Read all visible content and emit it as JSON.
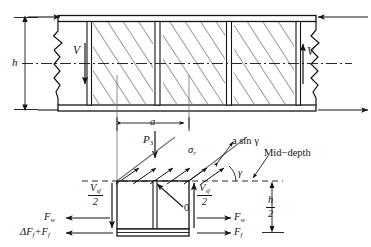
{
  "figure": {
    "type": "engineering-diagram",
    "colors": {
      "line": "#141414",
      "hatch": "#6e6e6e",
      "dash": "#2a2a2a",
      "background": "#ffffff"
    }
  },
  "upper_panel": {
    "name": "girder-elevation",
    "height_label": "h",
    "shear_left_label": "V",
    "shear_right_label": "V",
    "midline_style": "dash-dot",
    "stiffener_count": 4,
    "tension_field_angle_deg": 33
  },
  "lower_panel": {
    "name": "free-body-diagram",
    "panel_width_label": "a",
    "load_label": "P",
    "load_subscript": "3",
    "stress_label": "σ",
    "stress_subscript": "r",
    "diagonal_label": "a sin γ",
    "mid_depth_label": "Mid−depth",
    "angle_label": "γ",
    "origin_label": "0",
    "half_depth": {
      "numerator": "h",
      "denominator": "2"
    },
    "shear_left": {
      "symbol": "V",
      "subscript": "sf",
      "denominator": "2"
    },
    "shear_right": {
      "symbol": "V",
      "subscript": "sf",
      "denominator": "2"
    },
    "forces_left": [
      {
        "label": "F",
        "subscript": "w",
        "direction": "left"
      },
      {
        "label": "ΔF",
        "subscript": "f",
        "extra": "+F",
        "extra_subscript": "f",
        "direction": "left"
      }
    ],
    "forces_right": [
      {
        "label": "F",
        "subscript": "w",
        "direction": "right"
      },
      {
        "label": "F",
        "subscript": "f",
        "direction": "right"
      }
    ],
    "tension_arrow_count": 6
  }
}
